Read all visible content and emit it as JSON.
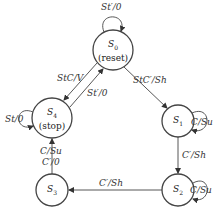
{
  "diagram": {
    "type": "state-machine",
    "states": [
      {
        "id": "S0",
        "name": "S",
        "sub": "0",
        "desc": "(reset)",
        "cx": 113,
        "cy": 50,
        "r": 20
      },
      {
        "id": "S1",
        "name": "S",
        "sub": "1",
        "desc": "",
        "cx": 178,
        "cy": 121,
        "r": 16
      },
      {
        "id": "S2",
        "name": "S",
        "sub": "2",
        "desc": "",
        "cx": 178,
        "cy": 190,
        "r": 16
      },
      {
        "id": "S3",
        "name": "S",
        "sub": "3",
        "desc": "",
        "cx": 52,
        "cy": 190,
        "r": 16
      },
      {
        "id": "S4",
        "name": "S",
        "sub": "4",
        "desc": "(stop)",
        "cx": 52,
        "cy": 118,
        "r": 20
      }
    ],
    "transitions": [
      {
        "from": "S0",
        "to": "S0",
        "label": "St′/0"
      },
      {
        "from": "S0",
        "to": "S1",
        "label": "StC′/Sh"
      },
      {
        "from": "S0",
        "to": "S4",
        "label": "StC/V"
      },
      {
        "from": "S4",
        "to": "S0",
        "label": "St′/0"
      },
      {
        "from": "S4",
        "to": "S4",
        "label": "St/0"
      },
      {
        "from": "S1",
        "to": "S1",
        "label": "C/Su"
      },
      {
        "from": "S1",
        "to": "S2",
        "label": "C′/Sh"
      },
      {
        "from": "S2",
        "to": "S2",
        "label": "C/Su"
      },
      {
        "from": "S2",
        "to": "S3",
        "label": "C′/Sh"
      },
      {
        "from": "S3",
        "to": "S4",
        "label": "C/Su"
      },
      {
        "from": "S3",
        "to": "S4",
        "label": "C′/0"
      }
    ]
  },
  "labels": {
    "s0_self": "St′/0",
    "s0_s1": "StC′/Sh",
    "s0_s4": "StC/V",
    "s4_s0": "St′/0",
    "s4_self": "St/0",
    "s1_self": "C/Su",
    "s1_s2": "C′/Sh",
    "s2_self": "C/Su",
    "s2_s3": "C′/Sh",
    "s3_s4_a": "C/Su",
    "s3_s4_b": "C′/0"
  },
  "states_text": {
    "s0": {
      "name": "S",
      "sub": "0",
      "desc": "(reset)"
    },
    "s1": {
      "name": "S",
      "sub": "1"
    },
    "s2": {
      "name": "S",
      "sub": "2"
    },
    "s3": {
      "name": "S",
      "sub": "3"
    },
    "s4": {
      "name": "S",
      "sub": "4",
      "desc": "(stop)"
    }
  }
}
